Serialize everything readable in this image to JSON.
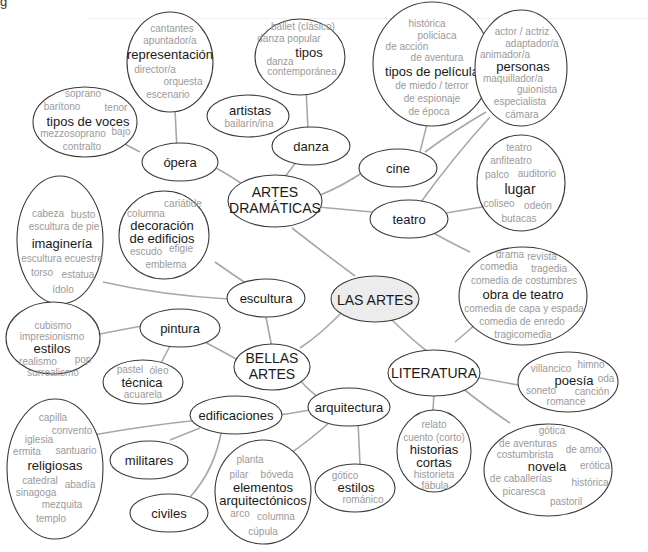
{
  "page_fragment": "g",
  "diagram": {
    "type": "mind-map",
    "root": "LAS ARTES",
    "colors": {
      "edge": "#a8a8a8",
      "outline": "#3a3a3a",
      "root_fill": "#ececec",
      "title_text": "#1a1a1a",
      "sub_text": "#9a9a9a"
    },
    "nodes": {
      "root": {
        "label": "LAS ARTES"
      },
      "artes_dramaticas": {
        "lines": [
          "ARTES",
          "DRAMÁTICAS"
        ]
      },
      "bellas_artes": {
        "lines": [
          "BELLAS",
          "ARTES"
        ]
      },
      "literatura": {
        "label": "LITERATURA"
      },
      "opera": {
        "label": "ópera"
      },
      "danza": {
        "label": "danza"
      },
      "cine": {
        "label": "cine"
      },
      "teatro": {
        "label": "teatro"
      },
      "escultura": {
        "label": "escultura"
      },
      "pintura": {
        "label": "pintura"
      },
      "arquitectura": {
        "label": "arquitectura"
      },
      "edificaciones": {
        "label": "edificaciones"
      },
      "militares": {
        "label": "militares"
      },
      "civiles": {
        "label": "civiles"
      },
      "representacion": {
        "title": "representación",
        "before": [
          "cantantes",
          "apuntador/a"
        ],
        "after": [
          "director/a",
          "orquesta",
          "escenario"
        ]
      },
      "tipos_de_voces": {
        "title": "tipos de voces",
        "items": [
          "soprano",
          "barítono",
          "tenor",
          "mezzosoprano",
          "bajo",
          "contralto"
        ]
      },
      "tipos_danza": {
        "title": "tipos",
        "items": [
          "ballet (clásico)",
          "danza popular",
          "danza",
          "contemporánea"
        ]
      },
      "artistas": {
        "title": "artistas",
        "items": [
          "bailarín/ina"
        ]
      },
      "tipos_de_pelicula": {
        "title": "tipos de película",
        "before": [
          "histórica",
          "policiaca",
          "de acción",
          "de aventura"
        ],
        "after": [
          "de miedo / terror",
          "de espionaje",
          "de época"
        ]
      },
      "personas": {
        "title": "personas",
        "before": [
          "actor / actriz",
          "adaptador/a",
          "animador/a"
        ],
        "after": [
          "maquillador/a",
          "guionista",
          "especialista",
          "cámara"
        ]
      },
      "lugar": {
        "title": "lugar",
        "items": [
          "teatro",
          "anfiteatro",
          "palco",
          "auditorio",
          "coliseo",
          "odeón",
          "butacas"
        ]
      },
      "obra_de_teatro": {
        "title": "obra de teatro",
        "items": [
          "drama",
          "revista",
          "comedia",
          "tragedia",
          "comedia de costumbres",
          "comedia de capa y espada",
          "comedia de enredo",
          "tragicomedia"
        ]
      },
      "decoracion": {
        "title_lines": [
          "decoración",
          "de edificios"
        ],
        "items": [
          "cariátide",
          "columna",
          "escudo",
          "efigie",
          "emblema"
        ]
      },
      "imagineria": {
        "title": "imaginería",
        "items": [
          "cabeza",
          "busto",
          "escultura de pie",
          "escultura ecuestre",
          "torso",
          "estatua",
          "ídolo"
        ]
      },
      "estilos_pintura": {
        "title": "estilos",
        "items": [
          "cubismo",
          "impresionismo",
          "realismo",
          "pop",
          "surrealismo"
        ]
      },
      "tecnica": {
        "title": "técnica",
        "items": [
          "pastel",
          "óleo",
          "acuarela"
        ]
      },
      "religiosas": {
        "title": "religiosas",
        "items": [
          "capilla",
          "convento",
          "iglesia",
          "ermita",
          "santuario",
          "catedral",
          "abadía",
          "sinagoga",
          "mezquita",
          "templo"
        ]
      },
      "elementos": {
        "title_lines": [
          "elementos",
          "arquitectónicos"
        ],
        "items": [
          "planta",
          "pilar",
          "bóveda",
          "arco",
          "columna",
          "cúpula"
        ]
      },
      "estilos_arq": {
        "title": "estilos",
        "items": [
          "gótico",
          "románico"
        ]
      },
      "historias_cortas": {
        "title_lines": [
          "historias",
          "cortas"
        ],
        "items": [
          "relato",
          "cuento (corto)",
          "historieta",
          "fábula"
        ]
      },
      "poesia": {
        "title": "poesía",
        "items": [
          "villancico",
          "himno",
          "oda",
          "soneto",
          "canción",
          "romance"
        ]
      },
      "novela": {
        "title": "novela",
        "items": [
          "gótica",
          "de aventuras",
          "de amor",
          "costumbrista",
          "erótica",
          "de caballerías",
          "histórica",
          "picaresca",
          "pastoril"
        ]
      }
    }
  }
}
